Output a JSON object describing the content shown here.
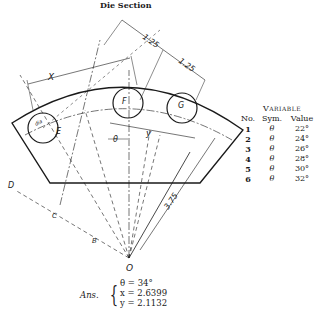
{
  "figure": {
    "title": "Die Section",
    "labels": {
      "dim_125_a": "1.25",
      "dim_125_b": "1.25",
      "dim_x": "X",
      "dim_y": "y",
      "dim_theta": "θ",
      "dim_375": "3.75",
      "dim_dia": "dia",
      "point_E": "E",
      "point_F": "F",
      "point_G": "G",
      "point_O": "O",
      "point_B": "B",
      "point_C": "C",
      "point_D": "D"
    }
  },
  "variable_table": {
    "title": "Variable",
    "headers": {
      "no": "No.",
      "sym": "Sym.",
      "value": "Value"
    },
    "rows": [
      {
        "no": "1",
        "sym": "θ",
        "value": "22°"
      },
      {
        "no": "2",
        "sym": "θ",
        "value": "24°"
      },
      {
        "no": "3",
        "sym": "θ",
        "value": "26°"
      },
      {
        "no": "4",
        "sym": "θ",
        "value": "28°"
      },
      {
        "no": "5",
        "sym": "θ",
        "value": "30°"
      },
      {
        "no": "6",
        "sym": "θ",
        "value": "32°"
      }
    ]
  },
  "answer": {
    "label": "Ans.",
    "theta": "θ = 34°",
    "x": "x = 2.6399",
    "y": "y = 2.1132"
  }
}
